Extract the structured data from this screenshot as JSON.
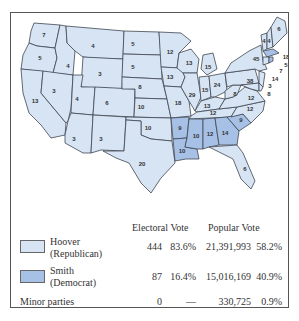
{
  "map": {
    "colors": {
      "hoover": "#d6e4f4",
      "smith": "#a7c0e6",
      "border": "#3f4650",
      "water": "#cfe0f2"
    },
    "states": [
      {
        "id": "WA",
        "ev": "7",
        "winner": "hoover"
      },
      {
        "id": "OR",
        "ev": "5",
        "winner": "hoover"
      },
      {
        "id": "CA",
        "ev": "13",
        "winner": "hoover"
      },
      {
        "id": "ID",
        "ev": "4",
        "winner": "hoover"
      },
      {
        "id": "NV",
        "ev": "3",
        "winner": "hoover"
      },
      {
        "id": "MT",
        "ev": "4",
        "winner": "hoover"
      },
      {
        "id": "WY",
        "ev": "3",
        "winner": "hoover"
      },
      {
        "id": "UT",
        "ev": "4",
        "winner": "hoover"
      },
      {
        "id": "CO",
        "ev": "6",
        "winner": "hoover"
      },
      {
        "id": "AZ",
        "ev": "3",
        "winner": "hoover"
      },
      {
        "id": "NM",
        "ev": "3",
        "winner": "hoover"
      },
      {
        "id": "ND",
        "ev": "5",
        "winner": "hoover"
      },
      {
        "id": "SD",
        "ev": "5",
        "winner": "hoover"
      },
      {
        "id": "NE",
        "ev": "8",
        "winner": "hoover"
      },
      {
        "id": "KS",
        "ev": "10",
        "winner": "hoover"
      },
      {
        "id": "OK",
        "ev": "10",
        "winner": "hoover"
      },
      {
        "id": "TX",
        "ev": "20",
        "winner": "hoover"
      },
      {
        "id": "MN",
        "ev": "12",
        "winner": "hoover"
      },
      {
        "id": "IA",
        "ev": "13",
        "winner": "hoover"
      },
      {
        "id": "MO",
        "ev": "18",
        "winner": "hoover"
      },
      {
        "id": "AR",
        "ev": "9",
        "winner": "smith"
      },
      {
        "id": "LA",
        "ev": "10",
        "winner": "smith"
      },
      {
        "id": "WI",
        "ev": "13",
        "winner": "hoover"
      },
      {
        "id": "IL",
        "ev": "29",
        "winner": "hoover"
      },
      {
        "id": "MI",
        "ev": "15",
        "winner": "hoover"
      },
      {
        "id": "IN",
        "ev": "15",
        "winner": "hoover"
      },
      {
        "id": "OH",
        "ev": "24",
        "winner": "hoover"
      },
      {
        "id": "KY",
        "ev": "13",
        "winner": "hoover"
      },
      {
        "id": "TN",
        "ev": "12",
        "winner": "hoover"
      },
      {
        "id": "MS",
        "ev": "10",
        "winner": "smith"
      },
      {
        "id": "AL",
        "ev": "12",
        "winner": "smith"
      },
      {
        "id": "GA",
        "ev": "14",
        "winner": "smith"
      },
      {
        "id": "FL",
        "ev": "6",
        "winner": "hoover"
      },
      {
        "id": "SC",
        "ev": "9",
        "winner": "smith"
      },
      {
        "id": "NC",
        "ev": "12",
        "winner": "hoover"
      },
      {
        "id": "VA",
        "ev": "12",
        "winner": "hoover"
      },
      {
        "id": "WV",
        "ev": "8",
        "winner": "hoover"
      },
      {
        "id": "PA",
        "ev": "38",
        "winner": "hoover"
      },
      {
        "id": "NY",
        "ev": "45",
        "winner": "hoover"
      },
      {
        "id": "VT",
        "ev": "4",
        "winner": "hoover"
      },
      {
        "id": "NH",
        "ev": "4",
        "winner": "hoover"
      },
      {
        "id": "ME",
        "ev": "6",
        "winner": "hoover"
      },
      {
        "id": "MA",
        "ev": "18",
        "winner": "smith"
      },
      {
        "id": "RI",
        "ev": "5",
        "winner": "smith"
      },
      {
        "id": "CT",
        "ev": "7",
        "winner": "hoover"
      },
      {
        "id": "NJ",
        "ev": "14",
        "winner": "hoover"
      },
      {
        "id": "DE",
        "ev": "3",
        "winner": "hoover"
      },
      {
        "id": "MD",
        "ev": "8",
        "winner": "hoover"
      }
    ]
  },
  "legend": {
    "headers": {
      "electoral": "Electoral Vote",
      "popular": "Popular Vote"
    },
    "rows": [
      {
        "name": "Hoover",
        "party": "(Republican)",
        "ev": "444",
        "ev_pct": "83.6%",
        "pop": "21,391,993",
        "pop_pct": "58.2%"
      },
      {
        "name": "Smith",
        "party": "(Democrat)",
        "ev": "87",
        "ev_pct": "16.4%",
        "pop": "15,016,169",
        "pop_pct": "40.9%"
      },
      {
        "name": "Minor parties",
        "party": "",
        "ev": "0",
        "ev_pct": "—",
        "pop": "330,725",
        "pop_pct": "0.9%"
      }
    ]
  }
}
